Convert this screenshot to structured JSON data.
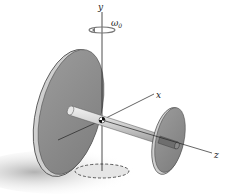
{
  "diagram": {
    "type": "rigid-body dynamics figure",
    "axes": {
      "y": "y",
      "x": "x",
      "z": "z"
    },
    "angular_velocity": {
      "symbol": "ω",
      "subscript": "0"
    },
    "colors": {
      "disk_face": "#8e8e8e",
      "disk_rim": "#c8c8c8",
      "shaft": "#d9d9d9",
      "shadow": "#bdbdbd",
      "axis_line": "#222222"
    }
  }
}
